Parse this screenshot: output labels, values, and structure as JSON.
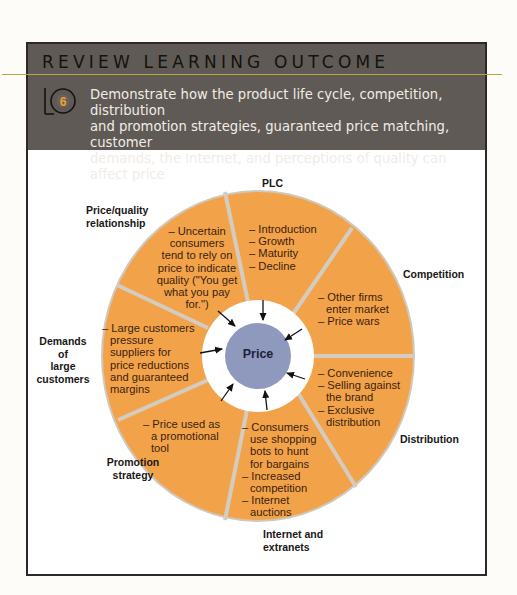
{
  "header": {
    "title": "REVIEW LEARNING OUTCOME",
    "lo_number": "6",
    "lo_letters": "LO",
    "objective_lines": [
      "Demonstrate how the product life cycle, competition, distribution",
      "and promotion strategies, guaranteed price matching, customer",
      "demands, the Internet, and perceptions of quality can affect price"
    ]
  },
  "diagram": {
    "center_label": "Price",
    "colors": {
      "segment_fill": "#f2a34a",
      "divider": "#cfc8bd",
      "inner_ring": "#ffffff",
      "center_fill": "#8f98bd",
      "header_bg": "#5f5a55",
      "rule": "#b7a93a",
      "badge_number": "#f0a030"
    },
    "segments": [
      {
        "label": "PLC",
        "items": [
          "– Introduction",
          "– Growth",
          "– Maturity",
          "– Decline"
        ]
      },
      {
        "label": "Competition",
        "items": [
          "– Other firms",
          "enter market",
          "– Price wars"
        ]
      },
      {
        "label": "Distribution",
        "items": [
          "– Convenience",
          "– Selling against",
          "the brand",
          "– Exclusive",
          "distribution"
        ]
      },
      {
        "label_lines": [
          "Internet and",
          "extranets"
        ],
        "items": [
          "– Consumers",
          "use shopping",
          "bots to hunt",
          "for bargains",
          "– Increased",
          "competition",
          "– Internet",
          "auctions"
        ]
      },
      {
        "label_lines": [
          "Promotion",
          "strategy"
        ],
        "items": [
          "– Price used as",
          "a promotional",
          "tool"
        ]
      },
      {
        "label_lines": [
          "Demands",
          "of",
          "large",
          "customers"
        ],
        "items": [
          "– Large customers",
          "pressure",
          "suppliers for",
          "price reductions",
          "and guaranteed",
          "margins"
        ]
      },
      {
        "label_lines": [
          "Price/quality",
          "relationship"
        ],
        "items": [
          "– Uncertain",
          "consumers",
          "tend to rely on",
          "price to indicate",
          "quality (\"You get",
          "what you pay",
          "for.\")"
        ]
      }
    ]
  }
}
